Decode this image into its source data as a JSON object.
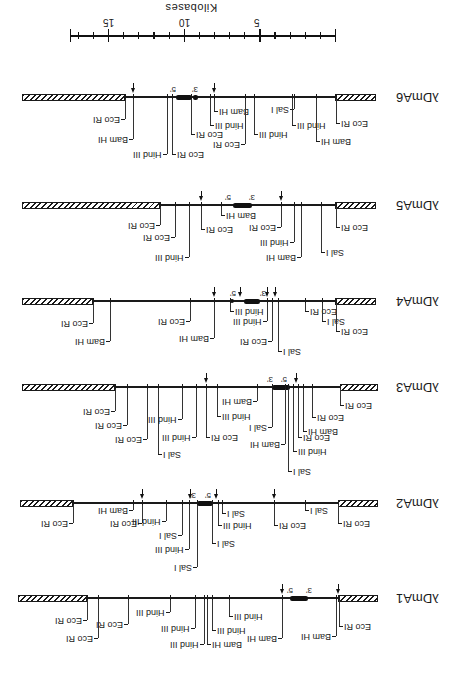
{
  "figure": {
    "orientation": "rotated 180 degrees",
    "scale": {
      "title": "Kilobases",
      "ticks": [
        {
          "label": "15",
          "x": 108
        },
        {
          "label": "10",
          "x": 184
        },
        {
          "label": "5",
          "x": 259
        }
      ],
      "x_start": 70,
      "x_end": 335,
      "y": 35
    },
    "constructs": [
      {
        "name": "λDmA6",
        "y": 97,
        "hatch_left": [
          22,
          125
        ],
        "line": [
          125,
          335
        ],
        "hatch_right": [
          335,
          376
        ],
        "gene": [
          176,
          192
        ],
        "gene2": [
          193,
          198
        ],
        "five_prime": {
          "label": "5'",
          "x": 173
        },
        "three_prime": {
          "label": "3'",
          "x": 195
        },
        "arrows": [
          133,
          214
        ],
        "sites": [
          {
            "label": "Eco RI",
            "x": 125,
            "len": 20,
            "side": "left"
          },
          {
            "label": "Bam HI",
            "x": 133,
            "len": 40,
            "side": "left"
          },
          {
            "label": "Hind III",
            "x": 167,
            "len": 55,
            "side": "left"
          },
          {
            "label": "Eco RI",
            "x": 172,
            "len": 55,
            "side": "right"
          },
          {
            "label": "Eco RI",
            "x": 191,
            "len": 35,
            "side": "right"
          },
          {
            "label": "Bam HI",
            "x": 214,
            "len": 12,
            "side": "right",
            "suffix": "₁"
          },
          {
            "label": "Hind III",
            "x": 210,
            "len": 26,
            "side": "right"
          },
          {
            "label": "Eco RI",
            "x": 245,
            "len": 45,
            "side": "left"
          },
          {
            "label": "Hind III",
            "x": 254,
            "len": 35,
            "side": "right"
          },
          {
            "label": "Sal I",
            "x": 294,
            "len": 10,
            "side": "left"
          },
          {
            "label": "Hind III",
            "x": 292,
            "len": 26,
            "side": "right"
          },
          {
            "label": "Bam HI",
            "x": 316,
            "len": 42,
            "side": "right"
          },
          {
            "label": "Eco RI",
            "x": 336,
            "len": 24,
            "side": "right"
          }
        ]
      },
      {
        "name": "λDmA5",
        "y": 205,
        "hatch_left": [
          22,
          160
        ],
        "line": [
          160,
          335
        ],
        "hatch_right": [
          335,
          376
        ],
        "gene": [
          233,
          252
        ],
        "five_prime": {
          "label": "5'",
          "x": 228
        },
        "three_prime": {
          "label": "3'",
          "x": 252
        },
        "arrows": [
          201,
          281
        ],
        "sites": [
          {
            "label": "Eco RI",
            "x": 160,
            "len": 18,
            "side": "left"
          },
          {
            "label": "Eco RI",
            "x": 175,
            "len": 30,
            "side": "left"
          },
          {
            "label": "Hind III",
            "x": 189,
            "len": 50,
            "side": "left"
          },
          {
            "label": "Eco RI",
            "x": 201,
            "len": 22,
            "side": "right"
          },
          {
            "label": "Bam HI",
            "x": 221,
            "len": 8,
            "side": "right"
          },
          {
            "label": "Eco RI",
            "x": 281,
            "len": 20,
            "side": "left"
          },
          {
            "label": "Hind III",
            "x": 294,
            "len": 35,
            "side": "left"
          },
          {
            "label": "Bam HI",
            "x": 301,
            "len": 50,
            "side": "left"
          },
          {
            "label": "Sal I",
            "x": 321,
            "len": 45,
            "side": "right"
          },
          {
            "label": "Eco RI",
            "x": 336,
            "len": 20,
            "side": "right"
          }
        ]
      },
      {
        "name": "λDmA4",
        "y": 301,
        "hatch_left": [
          22,
          93
        ],
        "line": [
          93,
          335
        ],
        "hatch_right": [
          335,
          376
        ],
        "gene": [
          244,
          260
        ],
        "five_prime": {
          "label": "5'",
          "x": 233
        },
        "three_prime": {
          "label": "3'",
          "x": 263
        },
        "arrows": [
          214,
          240,
          267,
          275
        ],
        "dots": [
          232
        ],
        "sites": [
          {
            "label": "Eco RI",
            "x": 93,
            "len": 20,
            "side": "left"
          },
          {
            "label": "Bam HI",
            "x": 110,
            "len": 38,
            "side": "left"
          },
          {
            "label": "Eco RI",
            "x": 190,
            "len": 18,
            "side": "left"
          },
          {
            "label": "Bam HI",
            "x": 214,
            "len": 35,
            "side": "left"
          },
          {
            "label": "Hind III",
            "x": 230,
            "len": 8,
            "side": "right"
          },
          {
            "label": "Hind III",
            "x": 267,
            "len": 18,
            "side": "left"
          },
          {
            "label": "Eco RI",
            "x": 272,
            "len": 38,
            "side": "left"
          },
          {
            "label": "Sal I",
            "x": 278,
            "len": 48,
            "side": "right"
          },
          {
            "label": "Eco RI",
            "x": 305,
            "len": 8,
            "side": "right"
          },
          {
            "label": "Sal I",
            "x": 322,
            "len": 18,
            "side": "right"
          },
          {
            "label": "Eco RI",
            "x": 336,
            "len": 28,
            "side": "right"
          }
        ]
      },
      {
        "name": "λDmA3",
        "y": 387,
        "hatch_left": [
          22,
          115
        ],
        "line": [
          115,
          340
        ],
        "hatch_right": [
          340,
          378
        ],
        "gene": [
          272,
          290
        ],
        "five_prime": {
          "label": "5'",
          "x": 284
        },
        "three_prime": {
          "label": "3'",
          "x": 270
        },
        "arrows": [
          206,
          296
        ],
        "sites": [
          {
            "label": "Eco RI",
            "x": 115,
            "len": 22,
            "side": "left"
          },
          {
            "label": "Eco RI",
            "x": 127,
            "len": 36,
            "side": "left"
          },
          {
            "label": "Eco RI",
            "x": 147,
            "len": 50,
            "side": "left"
          },
          {
            "label": "Sal I",
            "x": 158,
            "len": 65,
            "side": "right"
          },
          {
            "label": "Hind III",
            "x": 182,
            "len": 30,
            "side": "left"
          },
          {
            "label": "Hind III",
            "x": 196,
            "len": 48,
            "side": "left"
          },
          {
            "label": "Eco RI",
            "x": 206,
            "len": 48,
            "side": "right"
          },
          {
            "label": "Hind III",
            "x": 217,
            "len": 27,
            "side": "right"
          },
          {
            "label": "Bam HI",
            "x": 257,
            "len": 12,
            "side": "left"
          },
          {
            "label": "Sal I",
            "x": 272,
            "len": 38,
            "side": "left"
          },
          {
            "label": "Bam HI",
            "x": 285,
            "len": 55,
            "side": "left"
          },
          {
            "label": "Sal I",
            "x": 288,
            "len": 82,
            "side": "right"
          },
          {
            "label": "Hind III",
            "x": 293,
            "len": 62,
            "side": "right"
          },
          {
            "label": "Eco RI",
            "x": 298,
            "len": 48,
            "side": "right"
          },
          {
            "label": "Bam HI",
            "x": 303,
            "len": 42,
            "side": "right"
          },
          {
            "label": "Eco RI",
            "x": 312,
            "len": 28,
            "side": "right"
          },
          {
            "label": "Eco RI",
            "x": 340,
            "len": 16,
            "side": "right"
          }
        ]
      },
      {
        "name": "λDmA2",
        "y": 503,
        "hatch_left": [
          20,
          73
        ],
        "line": [
          73,
          338
        ],
        "hatch_right": [
          338,
          378
        ],
        "gene": [
          197,
          213
        ],
        "five_prime": {
          "label": "5'",
          "x": 208
        },
        "three_prime": {
          "label": "3'",
          "x": 193
        },
        "arrows": [
          142,
          190,
          216,
          274
        ],
        "sites": [
          {
            "label": "Eco RI",
            "x": 73,
            "len": 18,
            "side": "left"
          },
          {
            "label": "Bam HI",
            "x": 133,
            "len": 5,
            "side": "left"
          },
          {
            "label": "Eco RI",
            "x": 142,
            "len": 18,
            "side": "left"
          },
          {
            "label": "Hind III",
            "x": 166,
            "len": 16,
            "side": "left"
          },
          {
            "label": "Sal I",
            "x": 182,
            "len": 30,
            "side": "left"
          },
          {
            "label": "Hind III",
            "x": 189,
            "len": 44,
            "side": "left"
          },
          {
            "label": "Sal I",
            "x": 197,
            "len": 62,
            "side": "left"
          },
          {
            "label": "Sal I",
            "x": 212,
            "len": 38,
            "side": "right"
          },
          {
            "label": "Hind III",
            "x": 218,
            "len": 20,
            "side": "right"
          },
          {
            "label": "Sal I",
            "x": 222,
            "len": 8,
            "side": "right"
          },
          {
            "label": "Eco RI",
            "x": 274,
            "len": 20,
            "side": "right"
          },
          {
            "label": "Sal I",
            "x": 305,
            "len": 5,
            "side": "right"
          },
          {
            "label": "Eco RI",
            "x": 338,
            "len": 18,
            "side": "right"
          }
        ]
      },
      {
        "name": "λDmA1",
        "y": 598,
        "hatch_left": [
          18,
          87
        ],
        "line": [
          87,
          338
        ],
        "hatch_right": [
          338,
          378
        ],
        "gene": [
          290,
          308
        ],
        "five_prime": {
          "label": "5'",
          "x": 290
        },
        "three_prime": {
          "label": "3'",
          "x": 309
        },
        "arrows": [
          282,
          338
        ],
        "sites": [
          {
            "label": "Eco RI",
            "x": 87,
            "len": 20,
            "side": "left"
          },
          {
            "label": "Eco RI",
            "x": 98,
            "len": 38,
            "side": "left"
          },
          {
            "label": "Eco RI",
            "x": 128,
            "len": 24,
            "side": "left"
          },
          {
            "label": "Hind III",
            "x": 170,
            "len": 12,
            "side": "left"
          },
          {
            "label": "Hind III",
            "x": 195,
            "len": 28,
            "side": "left"
          },
          {
            "label": "Hind III",
            "x": 204,
            "len": 44,
            "side": "left"
          },
          {
            "label": "Bam HI",
            "x": 207,
            "len": 44,
            "side": "right"
          },
          {
            "label": "Hind III",
            "x": 212,
            "len": 30,
            "side": "right"
          },
          {
            "label": "Hind III",
            "x": 229,
            "len": 16,
            "side": "right"
          },
          {
            "label": "Bam HI",
            "x": 282,
            "len": 38,
            "side": "left"
          },
          {
            "label": "Bam HI",
            "x": 336,
            "len": 36,
            "side": "left"
          },
          {
            "label": "Eco RI",
            "x": 339,
            "len": 26,
            "side": "right"
          }
        ]
      }
    ]
  }
}
